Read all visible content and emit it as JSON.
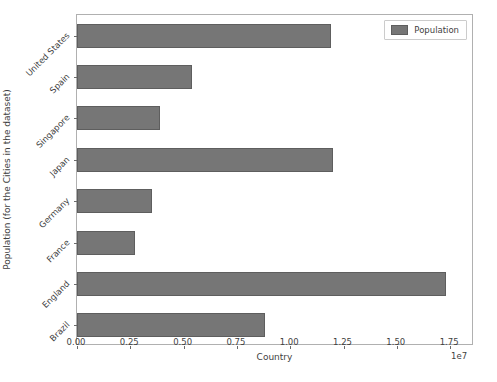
{
  "chart_data": {
    "type": "bar",
    "orientation": "horizontal",
    "title": "",
    "xlabel": "Country",
    "ylabel": "Population (for the Cities in the dataset)",
    "x_exponent_label": "1e7",
    "categories": [
      "Brazil",
      "England",
      "France",
      "Germany",
      "Japan",
      "Singapore",
      "Spain",
      "United States"
    ],
    "values": [
      8800000,
      17300000,
      2700000,
      3500000,
      12000000,
      3900000,
      5400000,
      11900000
    ],
    "xlim": [
      0,
      18620000
    ],
    "ylim": [
      -0.5,
      7.5
    ],
    "xticks": [
      0,
      2500000,
      5000000,
      7500000,
      10000000,
      12500000,
      15000000,
      17500000
    ],
    "xtick_labels": [
      "0.00",
      "0.25",
      "0.50",
      "0.75",
      "1.00",
      "1.25",
      "1.50",
      "1.75"
    ],
    "grid": false,
    "legend": {
      "entries": [
        "Population"
      ],
      "position": "upper right"
    },
    "series": [
      {
        "name": "Population",
        "color": "#767676",
        "values": [
          8800000,
          17300000,
          2700000,
          3500000,
          12000000,
          3900000,
          5400000,
          11900000
        ]
      }
    ]
  },
  "colors": {
    "bar_fill": "#767676",
    "bar_edge": "#5e5e5e",
    "axis": "#b0b0b0",
    "text": "#3f3f3f",
    "background": "#ffffff"
  }
}
